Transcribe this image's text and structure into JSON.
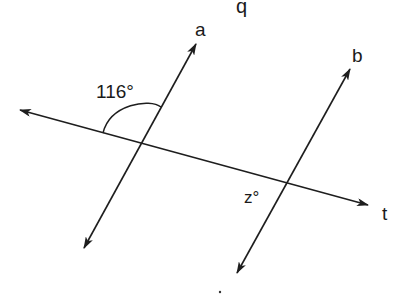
{
  "diagram": {
    "type": "geometry-parallel-lines-transversal",
    "colors": {
      "stroke": "#1e1e1e",
      "background": "#ffffff"
    },
    "labels": {
      "q": "q",
      "line_a": "a",
      "line_b": "b",
      "transversal": "t",
      "angle_given": "116°",
      "angle_unknown": "z°"
    },
    "lines": [
      {
        "name": "a",
        "from": [
          84,
          248
        ],
        "to": [
          196,
          44
        ],
        "arrows": "both"
      },
      {
        "name": "b",
        "from": [
          237,
          273
        ],
        "to": [
          350,
          69
        ],
        "arrows": "both"
      },
      {
        "name": "t",
        "from": [
          20,
          110
        ],
        "to": [
          368,
          205
        ],
        "arrows": "both"
      }
    ],
    "intersections": {
      "a_t": [
        143,
        144
      ],
      "b_t": [
        288,
        184
      ]
    },
    "angles": [
      {
        "label": "116°",
        "vertex": "a_t",
        "position": "upper-left",
        "arc": true
      },
      {
        "label": "z°",
        "vertex": "b_t",
        "position": "lower-left",
        "arc": false
      }
    ]
  }
}
